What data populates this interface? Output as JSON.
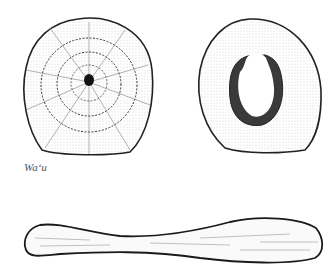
{
  "figure": {
    "caption": "Wa‘u",
    "items": [
      {
        "name": "grater-face-view",
        "shape": "rounded disc with concentric rings and radial striations, dark center"
      },
      {
        "name": "grater-back-view",
        "shape": "oval disc with central hole and shaded rim"
      },
      {
        "name": "grater-side-view",
        "shape": "elongated club / paddle shape"
      }
    ],
    "colors": {
      "ink": "#1a1a1a",
      "paper": "#ffffff"
    }
  }
}
